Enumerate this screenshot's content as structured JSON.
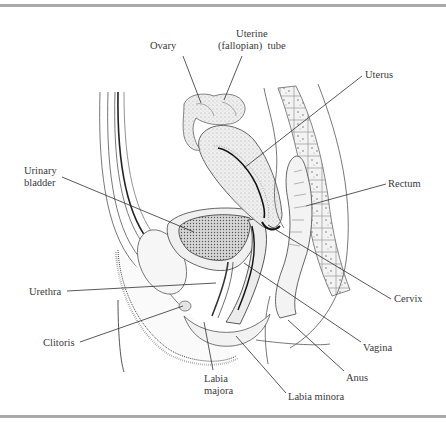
{
  "figure": {
    "labels": [
      {
        "id": "ovary",
        "text": "Ovary",
        "x": 150,
        "y": 40,
        "align": "left",
        "line": [
          183,
          56,
          201,
          103
        ]
      },
      {
        "id": "uterine-tube",
        "text": "Uterine\n(fallopian)  tube",
        "x": 218,
        "y": 28,
        "align": "center",
        "line": [
          242,
          56,
          224,
          100
        ]
      },
      {
        "id": "uterus",
        "text": "Uterus",
        "x": 365,
        "y": 69,
        "align": "left",
        "line": [
          362,
          76,
          244,
          168
        ]
      },
      {
        "id": "urinary-bladder",
        "text": "Urinary\nbladder",
        "x": 24,
        "y": 165,
        "align": "left",
        "line": [
          62,
          177,
          194,
          232
        ]
      },
      {
        "id": "rectum",
        "text": "Rectum",
        "x": 388,
        "y": 178,
        "align": "left",
        "line": [
          386,
          184,
          306,
          206
        ]
      },
      {
        "id": "urethra",
        "text": "Urethra",
        "x": 29,
        "y": 286,
        "align": "left",
        "line": [
          67,
          291,
          216,
          283
        ]
      },
      {
        "id": "cervix",
        "text": "Cervix",
        "x": 394,
        "y": 293,
        "align": "left",
        "line": [
          391,
          299,
          268,
          225
        ]
      },
      {
        "id": "clitoris",
        "text": "Clitoris",
        "x": 43,
        "y": 337,
        "align": "left",
        "line": [
          80,
          342,
          183,
          306
        ]
      },
      {
        "id": "vagina",
        "text": "Vagina",
        "x": 363,
        "y": 342,
        "align": "left",
        "line": [
          361,
          342,
          244,
          263
        ]
      },
      {
        "id": "anus",
        "text": "Anus",
        "x": 346,
        "y": 372,
        "align": "left",
        "line": [
          344,
          371,
          288,
          320
        ]
      },
      {
        "id": "labia-majora",
        "text": "Labia\nmajora",
        "x": 204,
        "y": 373,
        "align": "left",
        "line": [
          213,
          370,
          204,
          322
        ]
      },
      {
        "id": "labia-minora",
        "text": "Labia  minora",
        "x": 288,
        "y": 391,
        "align": "left",
        "line": [
          286,
          393,
          236,
          336
        ]
      }
    ]
  },
  "colors": {
    "text": "#3a3a3a",
    "line": "#2e2e2e",
    "rule": "#a9a9a9",
    "tissue": "#e9e9e9",
    "tissue_dark": "#9a9a9a"
  }
}
